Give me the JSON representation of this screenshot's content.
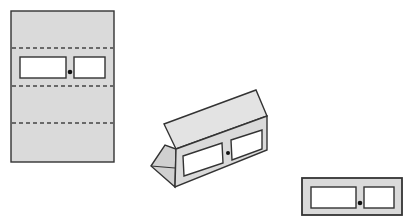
{
  "figure": {
    "colors": {
      "paper": "#dadada",
      "outline": "#333333",
      "window": "#ffffff",
      "knob": "#111111"
    },
    "panels": [
      {
        "name": "flat-sheet",
        "fold_lines": 3,
        "windows": 2,
        "knob": true
      },
      {
        "name": "folded-prism",
        "windows": 2,
        "knob": true
      },
      {
        "name": "front-view",
        "windows": 2,
        "knob": true
      }
    ]
  }
}
